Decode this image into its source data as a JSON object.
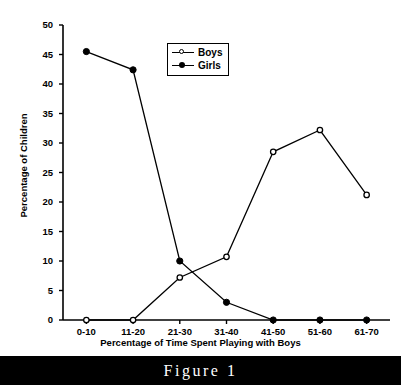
{
  "figure": {
    "caption": "Figure 1"
  },
  "legend": {
    "position": "upper-center",
    "entries": [
      {
        "label": "Boys",
        "marker": "open-circle-marker"
      },
      {
        "label": "Girls",
        "marker": "filled-circle-marker"
      }
    ]
  },
  "axes": {
    "y_tick_labels": [
      "0",
      "5",
      "10",
      "15",
      "20",
      "25",
      "30",
      "35",
      "40",
      "45",
      "50"
    ],
    "x_tick_labels": [
      "0-10",
      "11-20",
      "21-30",
      "31-40",
      "41-50",
      "51-60",
      "61-70"
    ]
  },
  "chart_data": {
    "type": "line",
    "title": "",
    "xlabel": "Percentage of Time Spent Playing with Boys",
    "ylabel": "Percentage of Children",
    "categories": [
      "0-10",
      "11-20",
      "21-30",
      "31-40",
      "41-50",
      "51-60",
      "61-70"
    ],
    "series": [
      {
        "name": "Boys",
        "marker": "open-circle",
        "values": [
          0,
          0,
          7.2,
          10.7,
          28.5,
          32.2,
          21.2
        ]
      },
      {
        "name": "Girls",
        "marker": "filled-circle",
        "values": [
          45.5,
          42.4,
          10.0,
          3.0,
          0,
          0,
          0
        ]
      }
    ],
    "ylim": [
      0,
      50
    ],
    "ytick_step": 5,
    "grid": false,
    "legend_position": "upper-center",
    "line_color": "#000000"
  }
}
